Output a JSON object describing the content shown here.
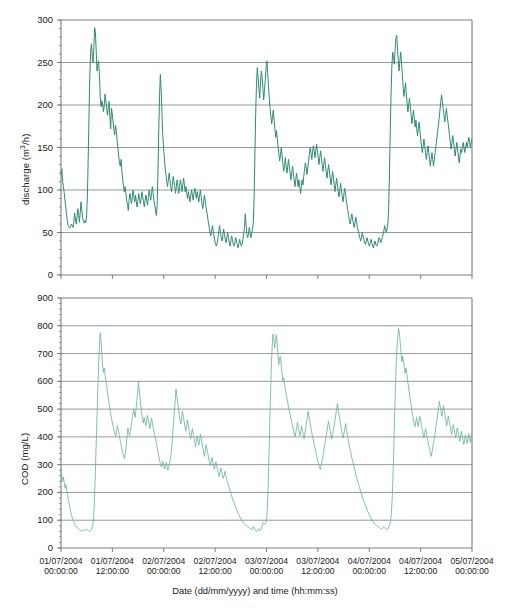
{
  "figure": {
    "xlabel": "Date (dd/mm/yyyy) and time (hh:mm:ss)",
    "line_color": "#2e8b74",
    "axis_color": "#6f6f6f",
    "grid_color": "#8d8d8d"
  },
  "xticks": [
    {
      "date": "01/07/2004",
      "time": "00:00:00"
    },
    {
      "date": "01/07/2004",
      "time": "12:00:00"
    },
    {
      "date": "02/07/2004",
      "time": "00:00:00"
    },
    {
      "date": "02/07/2004",
      "time": "12:00:00"
    },
    {
      "date": "03/07/2004",
      "time": "00:00:00"
    },
    {
      "date": "03/07/2004",
      "time": "12:00:00"
    },
    {
      "date": "04/07/2004",
      "time": "00:00:00"
    },
    {
      "date": "04/07/2004",
      "time": "12:00:00"
    },
    {
      "date": "05/07/2004",
      "time": "00:00:00"
    }
  ],
  "chart_data": [
    {
      "type": "line",
      "id": "discharge",
      "title": "",
      "ylabel": "discharge (m3/h)",
      "ylabel_html": "discharge (m<sup>3</sup>/h)",
      "xlabel": "Date (dd/mm/yyyy) and time (hh:mm:ss)",
      "ylim": [
        0,
        300
      ],
      "ytick_step": 50,
      "yticks": [
        0,
        50,
        100,
        150,
        200,
        250,
        300
      ],
      "xlim": [
        "01/07/2004 00:00:00",
        "05/07/2004 00:00:00"
      ],
      "x_hours_span": 96,
      "grid": "horizontal",
      "legend": "none",
      "series": [
        {
          "name": "discharge",
          "color": "#2e8b74",
          "units": "m3/h",
          "sample_interval_minutes": 15,
          "values": [
            118,
            125,
            110,
            104,
            97,
            88,
            79,
            70,
            63,
            58,
            56,
            55,
            57,
            60,
            58,
            56,
            62,
            73,
            66,
            60,
            68,
            78,
            70,
            62,
            74,
            86,
            76,
            68,
            63,
            61,
            64,
            62,
            70,
            95,
            140,
            190,
            235,
            262,
            272,
            258,
            250,
            268,
            291,
            285,
            262,
            240,
            248,
            252,
            234,
            210,
            198,
            205,
            200,
            192,
            200,
            213,
            205,
            196,
            188,
            197,
            204,
            186,
            172,
            196,
            190,
            180,
            172,
            165,
            176,
            170,
            158,
            150,
            140,
            132,
            128,
            136,
            122,
            112,
            105,
            98,
            104,
            96,
            88,
            82,
            76,
            88,
            96,
            90,
            84,
            92,
            100,
            92,
            86,
            94,
            86,
            80,
            88,
            96,
            90,
            84,
            90,
            98,
            92,
            86,
            80,
            88,
            94,
            88,
            82,
            92,
            100,
            94,
            88,
            96,
            104,
            96,
            88,
            82,
            76,
            70,
            82,
            120,
            170,
            210,
            236,
            218,
            190,
            165,
            150,
            138,
            126,
            118,
            110,
            104,
            112,
            120,
            112,
            104,
            98,
            106,
            116,
            110,
            104,
            96,
            104,
            112,
            104,
            96,
            104,
            112,
            106,
            98,
            106,
            114,
            106,
            98,
            104,
            96,
            90,
            98,
            92,
            86,
            94,
            100,
            94,
            88,
            96,
            102,
            96,
            90,
            98,
            92,
            86,
            94,
            100,
            92,
            84,
            78,
            86,
            94,
            88,
            80,
            74,
            68,
            62,
            56,
            50,
            46,
            52,
            58,
            52,
            46,
            40,
            36,
            34,
            38,
            44,
            52,
            58,
            50,
            44,
            40,
            46,
            54,
            48,
            42,
            38,
            44,
            50,
            44,
            38,
            34,
            40,
            46,
            42,
            36,
            34,
            38,
            44,
            40,
            36,
            32,
            36,
            42,
            38,
            34,
            36,
            42,
            48,
            56,
            72,
            60,
            48,
            44,
            48,
            56,
            50,
            44,
            48,
            54,
            60,
            90,
            140,
            190,
            224,
            244,
            232,
            220,
            208,
            226,
            240,
            234,
            220,
            206,
            218,
            230,
            244,
            252,
            238,
            222,
            208,
            196,
            186,
            178,
            186,
            194,
            182,
            172,
            162,
            170,
            160,
            150,
            142,
            134,
            142,
            150,
            140,
            130,
            122,
            130,
            138,
            128,
            120,
            128,
            136,
            128,
            120,
            112,
            120,
            128,
            120,
            112,
            104,
            112,
            120,
            112,
            104,
            112,
            104,
            96,
            104,
            112,
            106,
            116,
            124,
            132,
            126,
            118,
            126,
            134,
            142,
            150,
            144,
            136,
            144,
            152,
            146,
            138,
            146,
            154,
            146,
            138,
            130,
            138,
            146,
            138,
            130,
            122,
            130,
            138,
            130,
            122,
            114,
            122,
            130,
            122,
            114,
            106,
            114,
            122,
            114,
            106,
            98,
            106,
            114,
            106,
            98,
            92,
            100,
            108,
            100,
            92,
            86,
            94,
            102,
            96,
            88,
            82,
            76,
            70,
            64,
            60,
            66,
            72,
            66,
            60,
            56,
            62,
            68,
            62,
            56,
            52,
            48,
            44,
            40,
            44,
            50,
            46,
            42,
            38,
            36,
            40,
            44,
            40,
            36,
            34,
            38,
            42,
            38,
            34,
            32,
            36,
            40,
            36,
            34,
            36,
            40,
            44,
            42,
            38,
            40,
            44,
            48,
            52,
            58,
            54,
            50,
            54,
            60,
            80,
            120,
            170,
            214,
            246,
            262,
            256,
            248,
            264,
            278,
            282,
            268,
            252,
            240,
            252,
            262,
            250,
            236,
            222,
            210,
            218,
            226,
            214,
            202,
            192,
            200,
            208,
            198,
            188,
            178,
            186,
            194,
            184,
            174,
            182,
            172,
            164,
            172,
            180,
            170,
            160,
            152,
            144,
            152,
            160,
            152,
            144,
            136,
            144,
            152,
            144,
            136,
            128,
            136,
            144,
            136,
            128,
            136,
            144,
            152,
            160,
            168,
            176,
            184,
            194,
            204,
            212,
            204,
            196,
            188,
            180,
            188,
            196,
            188,
            180,
            172,
            164,
            156,
            148,
            156,
            164,
            156,
            148,
            140,
            148,
            156,
            148,
            140,
            132,
            140,
            148,
            144,
            150,
            156,
            150,
            144,
            150,
            156,
            150,
            156,
            162,
            156,
            150,
            156,
            160
          ]
        }
      ],
      "description": "Strongly diurnal wastewater discharge: four daily cycles with night minima near 35-60 m3/h and daytime peaks of 230-290 m3/h."
    },
    {
      "type": "line",
      "id": "cod",
      "title": "",
      "ylabel": "COD (mg/L)",
      "xlabel": "Date (dd/mm/yyyy) and time (hh:mm:ss)",
      "ylim": [
        0,
        900
      ],
      "ytick_step": 100,
      "yticks": [
        0,
        100,
        200,
        300,
        400,
        500,
        600,
        700,
        800,
        900
      ],
      "xlim": [
        "01/07/2004 00:00:00",
        "05/07/2004 00:00:00"
      ],
      "x_hours_span": 96,
      "grid": "horizontal",
      "legend": "none",
      "series": [
        {
          "name": "COD",
          "color": "#6bb3a0",
          "units": "mg/L",
          "sample_interval_minutes": 15,
          "values": [
            285,
            262,
            240,
            255,
            235,
            215,
            228,
            210,
            190,
            175,
            160,
            145,
            130,
            118,
            108,
            100,
            92,
            86,
            80,
            76,
            72,
            70,
            68,
            66,
            64,
            63,
            62,
            62,
            63,
            64,
            66,
            68,
            66,
            64,
            62,
            60,
            62,
            66,
            72,
            84,
            110,
            170,
            260,
            360,
            460,
            560,
            650,
            720,
            775,
            755,
            700,
            660,
            632,
            648,
            626,
            600,
            585,
            560,
            540,
            520,
            500,
            482,
            466,
            450,
            438,
            425,
            412,
            400,
            420,
            440,
            430,
            412,
            396,
            380,
            366,
            352,
            340,
            330,
            322,
            340,
            368,
            400,
            432,
            420,
            404,
            420,
            440,
            460,
            478,
            500,
            486,
            470,
            500,
            530,
            560,
            598,
            570,
            540,
            510,
            486,
            466,
            450,
            470,
            456,
            440,
            460,
            478,
            462,
            446,
            430,
            450,
            468,
            452,
            436,
            420,
            404,
            390,
            376,
            360,
            344,
            330,
            316,
            300,
            292,
            300,
            312,
            296,
            284,
            296,
            308,
            292,
            280,
            290,
            302,
            318,
            340,
            370,
            410,
            450,
            490,
            530,
            572,
            552,
            526,
            500,
            480,
            462,
            446,
            470,
            492,
            474,
            456,
            438,
            420,
            440,
            462,
            444,
            426,
            408,
            392,
            410,
            430,
            412,
            396,
            380,
            364,
            384,
            404,
            386,
            370,
            390,
            410,
            392,
            376,
            360,
            344,
            330,
            350,
            372,
            356,
            340,
            324,
            310,
            296,
            310,
            326,
            312,
            298,
            284,
            296,
            310,
            296,
            282,
            270,
            258,
            272,
            288,
            274,
            262,
            250,
            262,
            276,
            262,
            250,
            240,
            230,
            220,
            210,
            200,
            190,
            180,
            172,
            164,
            156,
            148,
            140,
            133,
            126,
            120,
            114,
            108,
            103,
            98,
            94,
            90,
            86,
            83,
            80,
            78,
            76,
            74,
            72,
            70,
            68,
            66,
            72,
            78,
            72,
            66,
            62,
            60,
            64,
            70,
            66,
            62,
            66,
            74,
            84,
            92,
            88,
            86,
            92,
            100,
            140,
            220,
            330,
            450,
            560,
            660,
            730,
            770,
            752,
            720,
            742,
            768,
            745,
            700,
            660,
            686,
            690,
            660,
            630,
            602,
            612,
            596,
            574,
            556,
            540,
            524,
            508,
            494,
            480,
            466,
            452,
            440,
            426,
            412,
            400,
            416,
            436,
            452,
            436,
            420,
            404,
            420,
            440,
            424,
            408,
            392,
            410,
            430,
            448,
            470,
            492,
            476,
            458,
            440,
            424,
            408,
            394,
            380,
            366,
            352,
            340,
            326,
            312,
            300,
            290,
            282,
            296,
            312,
            326,
            344,
            364,
            384,
            400,
            418,
            438,
            456,
            440,
            424,
            408,
            392,
            408,
            424,
            440,
            460,
            482,
            500,
            520,
            498,
            478,
            460,
            442,
            426,
            410,
            396,
            412,
            430,
            448,
            428,
            410,
            394,
            378,
            362,
            348,
            334,
            320,
            308,
            296,
            284,
            272,
            260,
            248,
            238,
            228,
            218,
            208,
            198,
            188,
            180,
            172,
            164,
            156,
            148,
            140,
            132,
            126,
            120,
            114,
            108,
            102,
            98,
            94,
            90,
            86,
            83,
            80,
            78,
            76,
            74,
            72,
            70,
            68,
            70,
            74,
            78,
            74,
            70,
            68,
            66,
            70,
            76,
            84,
            96,
            120,
            170,
            250,
            350,
            460,
            570,
            660,
            720,
            760,
            790,
            770,
            740,
            700,
            670,
            690,
            672,
            650,
            630,
            648,
            628,
            606,
            584,
            562,
            540,
            520,
            500,
            482,
            466,
            450,
            436,
            452,
            470,
            454,
            438,
            456,
            474,
            458,
            442,
            426,
            410,
            396,
            412,
            430,
            414,
            398,
            384,
            370,
            356,
            342,
            330,
            346,
            364,
            380,
            400,
            420,
            442,
            462,
            484,
            506,
            528,
            510,
            492,
            474,
            492,
            512,
            494,
            476,
            458,
            440,
            458,
            476,
            458,
            440,
            424,
            408,
            426,
            444,
            428,
            412,
            396,
            414,
            432,
            416,
            400,
            384,
            402,
            420,
            404,
            388,
            372,
            390,
            408,
            392,
            376,
            394,
            412,
            396,
            380,
            396,
            412
          ]
        }
      ],
      "description": "COD concentration follows the same diurnal pattern as discharge, with night minima of 60-100 mg/L and daytime peaks of 760-790 mg/L."
    }
  ]
}
